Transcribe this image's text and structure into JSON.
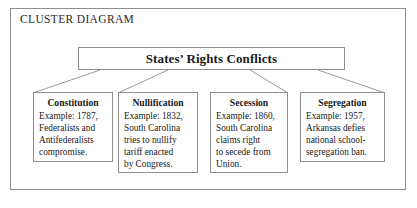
{
  "frame": {
    "label": "CLUSTER DIAGRAM"
  },
  "colors": {
    "border": "#8e8e8e",
    "text": "#1a1a1a",
    "background": "#ffffff",
    "connector": "#9a9a9a"
  },
  "diagram": {
    "type": "cluster-diagram",
    "root": {
      "title": "States’ Rights Conflicts"
    },
    "children": [
      {
        "title": "Constitution",
        "lines": [
          "Example: 1787,",
          "Federalists and",
          "Antifederalists",
          "compromise."
        ]
      },
      {
        "title": "Nullification",
        "lines": [
          "Example: 1832,",
          "South Carolina",
          "tries to nullify",
          "tariff enacted",
          "by Congress."
        ]
      },
      {
        "title": "Secession",
        "lines": [
          "Example: 1860,",
          "South Carolina",
          "claims right",
          "to secede from",
          "Union."
        ]
      },
      {
        "title": "Segregation",
        "lines": [
          "Example: 1957,",
          "Arkansas defies",
          "national school-",
          "segregation ban."
        ]
      }
    ]
  }
}
